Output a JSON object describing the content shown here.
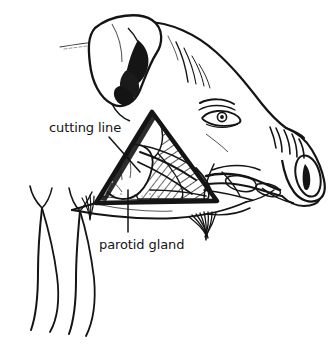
{
  "figure": {
    "kind": "anatomical-line-drawing",
    "background_color": "#ffffff",
    "ink_color": "#141414"
  },
  "labels": [
    {
      "id": "cutting-line",
      "text": "cutting line",
      "x": 49,
      "y": 120,
      "leader": {
        "from_x": 109,
        "from_y": 137,
        "to_x": 140,
        "to_y": 172
      }
    },
    {
      "id": "parotid-gland",
      "text": "parotid gland",
      "x": 99,
      "y": 237,
      "leader": {
        "from_x": 128,
        "from_y": 190,
        "to_x": 128,
        "to_y": 232
      }
    }
  ],
  "structures": {
    "ear": "floppy ear with shaded inner fold",
    "eye": "eye with brow lines and iris",
    "snout": "wrinkled snout with nose disc",
    "cut_flap": "triangular skin flap outlined by heavy cutting line",
    "masseter": "hatched masseter muscle inside flap",
    "gland": "pale lobed parotid gland",
    "vessels": "vessel and duct bundle running toward jaw",
    "bristles": "bristle tuft under jaw",
    "neck": "two tapering neck and foreleg contours at lower left"
  }
}
